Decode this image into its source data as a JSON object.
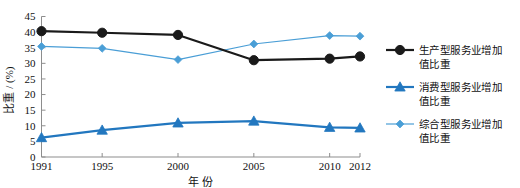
{
  "chart_data": {
    "type": "line",
    "title": "",
    "xlabel": "年 份",
    "ylabel": "比重 / (%)",
    "categories": [
      "1991",
      "1995",
      "2000",
      "2005",
      "2010",
      "2012"
    ],
    "x": [
      1991,
      1995,
      2000,
      2005,
      2010,
      2012
    ],
    "xlim": [
      1991,
      2012
    ],
    "ylim": [
      0,
      45
    ],
    "yticks": [
      0,
      5,
      10,
      15,
      20,
      25,
      30,
      35,
      40,
      45
    ],
    "ytick_labels": [
      "0",
      "5",
      "10",
      "15",
      "20",
      "25",
      "30",
      "35",
      "40",
      "45"
    ],
    "grid": false,
    "legend_position": "right",
    "series": [
      {
        "name": "生产型服务业增加值比重",
        "label_line1": "生产型服务业增加",
        "label_line2": "值比重",
        "marker": "circle",
        "color": "#1a1a1a",
        "line_width": 2.2,
        "values": [
          40.3,
          39.8,
          39.1,
          31.0,
          31.5,
          32.2
        ]
      },
      {
        "name": "消费型服务业增加值比重",
        "label_line1": "消费型服务业增加",
        "label_line2": "值比重",
        "marker": "triangle",
        "color": "#2277bf",
        "line_width": 2.2,
        "values": [
          6.2,
          8.6,
          10.9,
          11.5,
          9.5,
          9.3
        ]
      },
      {
        "name": "综合型服务业增加值比重",
        "label_line1": "综合型服务业增加",
        "label_line2": "值比重",
        "marker": "diamond",
        "color": "#4a9ed6",
        "line_width": 1.2,
        "values": [
          35.4,
          34.8,
          31.2,
          36.2,
          38.9,
          38.7
        ]
      }
    ]
  },
  "axis": {
    "y_title": "比重 / (%)",
    "x_title": "年 份"
  },
  "legend": {
    "items": [
      {
        "line1": "生产型服务业增加",
        "line2": "值比重",
        "marker": "circle-marker-icon",
        "color": "#1a1a1a"
      },
      {
        "line1": "消费型服务业增加",
        "line2": "值比重",
        "marker": "triangle-marker-icon",
        "color": "#2277bf"
      },
      {
        "line1": "综合型服务业增加",
        "line2": "值比重",
        "marker": "diamond-marker-icon",
        "color": "#4a9ed6"
      }
    ]
  },
  "colors": {
    "series_black": "#1a1a1a",
    "series_blue_strong": "#2277bf",
    "series_blue_light": "#4a9ed6",
    "axis": "#8d8d8d",
    "background": "#ffffff"
  }
}
